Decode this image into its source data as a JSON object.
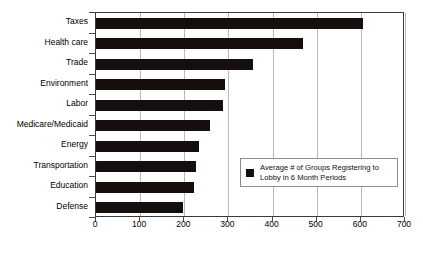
{
  "chart_data": {
    "type": "bar",
    "orientation": "horizontal",
    "title": "",
    "xlabel": "",
    "ylabel": "",
    "categories": [
      "Taxes",
      "Health care",
      "Trade",
      "Environment",
      "Labor",
      "Medicare/Medicaid",
      "Energy",
      "Transportation",
      "Education",
      "Defense"
    ],
    "values": [
      605,
      470,
      355,
      293,
      287,
      258,
      233,
      226,
      222,
      196
    ],
    "xlim": [
      0,
      700
    ],
    "xticks": [
      0,
      100,
      200,
      300,
      400,
      500,
      600,
      700
    ],
    "xtick_labels": [
      "0",
      "100",
      "200",
      "300",
      "400",
      "500",
      "600",
      "700"
    ],
    "grid": "vertical",
    "legend": {
      "position": "inside-right-lower",
      "entries": [
        {
          "label": "Average # of Groups Registering to Lobby in 6 Month Periods",
          "color": "#140f0c",
          "marker": "filled-square"
        }
      ]
    },
    "colors": {
      "bar": "#140f0c",
      "grid": "#b9b9b9",
      "frame": "#3a3a3a",
      "background": "#ffffff"
    }
  }
}
